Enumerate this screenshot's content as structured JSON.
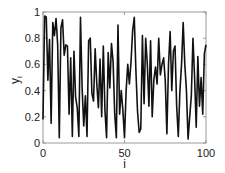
{
  "chart_data": {
    "type": "line",
    "title": "",
    "xlabel": "i",
    "ylabel": "y",
    "ylabel_subscript": "i",
    "xlim": [
      0,
      100
    ],
    "ylim": [
      0,
      1
    ],
    "xticks": [
      0,
      50,
      100
    ],
    "xtick_labels": [
      "0",
      "50",
      "100"
    ],
    "yticks": [
      0,
      0.2,
      0.4,
      0.6,
      0.8,
      1
    ],
    "ytick_labels": [
      "0",
      "0.2",
      "0.4",
      "0.6",
      "0.8",
      "1"
    ],
    "grid": false,
    "legend": null,
    "series": [
      {
        "name": "y_i",
        "color": "#111111",
        "x": [
          0,
          1,
          2,
          3,
          4,
          5,
          6,
          7,
          8,
          9,
          10,
          11,
          12,
          13,
          14,
          15,
          16,
          17,
          18,
          19,
          20,
          21,
          22,
          23,
          24,
          25,
          26,
          27,
          28,
          29,
          30,
          31,
          32,
          33,
          34,
          35,
          36,
          37,
          38,
          39,
          40,
          41,
          42,
          43,
          44,
          45,
          46,
          47,
          48,
          49,
          50,
          51,
          52,
          53,
          54,
          55,
          56,
          57,
          58,
          59,
          60,
          61,
          62,
          63,
          64,
          65,
          66,
          67,
          68,
          69,
          70,
          71,
          72,
          73,
          74,
          75,
          76,
          77,
          78,
          79,
          80,
          81,
          82,
          83,
          84,
          85,
          86,
          87,
          88,
          89,
          90,
          91,
          92,
          93,
          94,
          95,
          96,
          97,
          98,
          99,
          100
        ],
        "values": [
          0.18,
          0.97,
          0.96,
          0.48,
          0.79,
          0.15,
          0.92,
          0.82,
          0.95,
          0.75,
          0.04,
          0.88,
          0.94,
          0.67,
          0.75,
          0.74,
          0.22,
          0.65,
          0.05,
          0.7,
          0.35,
          0.27,
          0.05,
          0.96,
          0.42,
          0.13,
          0.36,
          0.05,
          0.78,
          0.8,
          0.38,
          0.32,
          0.72,
          0.45,
          0.27,
          0.64,
          0.2,
          0.74,
          0.25,
          0.04,
          0.69,
          0.42,
          0.76,
          0.62,
          0.22,
          0.04,
          0.9,
          0.22,
          0.4,
          0.25,
          0.04,
          0.4,
          0.6,
          0.45,
          0.62,
          0.86,
          0.96,
          0.55,
          0.24,
          0.08,
          0.11,
          0.82,
          0.3,
          0.8,
          0.6,
          0.28,
          0.78,
          0.2,
          0.48,
          0.58,
          0.45,
          0.8,
          0.52,
          0.6,
          0.65,
          0.48,
          0.07,
          0.6,
          0.85,
          0.4,
          0.7,
          0.74,
          0.28,
          0.05,
          0.4,
          0.6,
          0.92,
          0.6,
          0.4,
          0.03,
          0.2,
          0.36,
          0.8,
          0.5,
          0.12,
          0.66,
          0.28,
          0.5,
          0.22,
          0.68,
          0.75
        ]
      }
    ],
    "frame": {
      "left": 43,
      "right": 206,
      "top": 12,
      "bottom": 143
    },
    "colors": {
      "axis": "#9a9a9a",
      "line": "#111111",
      "text": "#222222"
    }
  }
}
